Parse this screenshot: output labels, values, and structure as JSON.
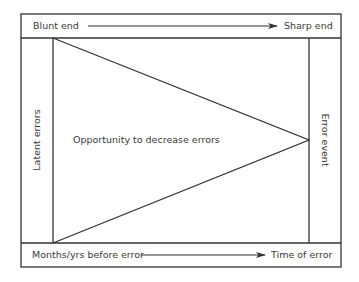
{
  "diagram": {
    "top_band": {
      "left_label": "Blunt end",
      "right_label": "Sharp end"
    },
    "bottom_band": {
      "left_label": "Months/yrs before error",
      "right_label": "Time of error"
    },
    "left_column": {
      "label": "Latent errors"
    },
    "right_column": {
      "label": "Error event"
    },
    "center": {
      "label": "Opportunity to decrease errors"
    },
    "colors": {
      "line": "#333333",
      "background": "#ffffff"
    }
  }
}
